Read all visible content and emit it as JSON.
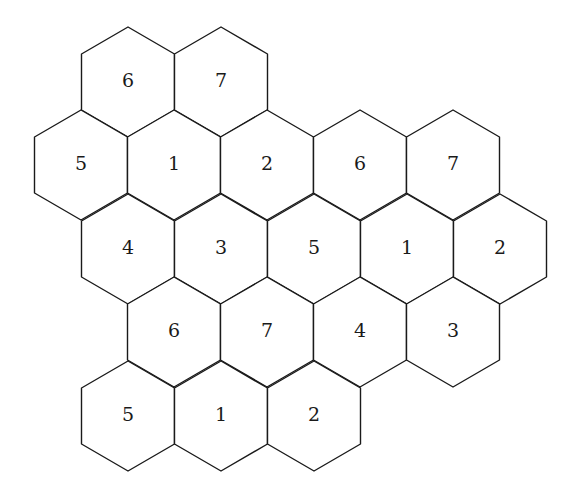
{
  "diagram": {
    "type": "hexagonal-tiling",
    "orientation": "pointy-top",
    "colors": {
      "stroke": "#1a1a1a",
      "fill": "#ffffff",
      "text": "#1a1a1a"
    },
    "geometry": {
      "half_width": 46.5,
      "corner_dy": 28,
      "tip_dy": 55
    },
    "cells": [
      {
        "row": 0,
        "cx": 128,
        "cy": 82,
        "label": "6"
      },
      {
        "row": 0,
        "cx": 221,
        "cy": 82,
        "label": "7"
      },
      {
        "row": 1,
        "cx": 81,
        "cy": 165,
        "label": "5"
      },
      {
        "row": 1,
        "cx": 174,
        "cy": 165,
        "label": "1"
      },
      {
        "row": 1,
        "cx": 267,
        "cy": 165,
        "label": "2"
      },
      {
        "row": 1,
        "cx": 360,
        "cy": 165,
        "label": "6"
      },
      {
        "row": 1,
        "cx": 453,
        "cy": 165,
        "label": "7"
      },
      {
        "row": 2,
        "cx": 128,
        "cy": 249,
        "label": "4"
      },
      {
        "row": 2,
        "cx": 221,
        "cy": 249,
        "label": "3"
      },
      {
        "row": 2,
        "cx": 314,
        "cy": 249,
        "label": "5"
      },
      {
        "row": 2,
        "cx": 407,
        "cy": 249,
        "label": "1"
      },
      {
        "row": 2,
        "cx": 500,
        "cy": 249,
        "label": "2"
      },
      {
        "row": 3,
        "cx": 174,
        "cy": 332,
        "label": "6"
      },
      {
        "row": 3,
        "cx": 267,
        "cy": 332,
        "label": "7"
      },
      {
        "row": 3,
        "cx": 360,
        "cy": 332,
        "label": "4"
      },
      {
        "row": 3,
        "cx": 453,
        "cy": 332,
        "label": "3"
      },
      {
        "row": 4,
        "cx": 128,
        "cy": 416,
        "label": "5"
      },
      {
        "row": 4,
        "cx": 221,
        "cy": 416,
        "label": "1"
      },
      {
        "row": 4,
        "cx": 314,
        "cy": 416,
        "label": "2"
      }
    ]
  }
}
